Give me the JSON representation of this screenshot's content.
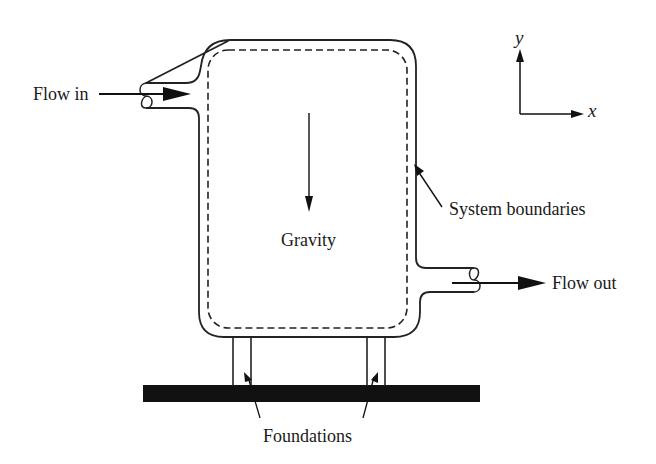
{
  "labels": {
    "flow_in": "Flow in",
    "flow_out": "Flow out",
    "gravity": "Gravity",
    "system_boundaries": "System boundaries",
    "foundations": "Foundations",
    "axis_x": "x",
    "axis_y": "y"
  },
  "colors": {
    "ink": "#1a1a1a",
    "background": "#ffffff"
  }
}
